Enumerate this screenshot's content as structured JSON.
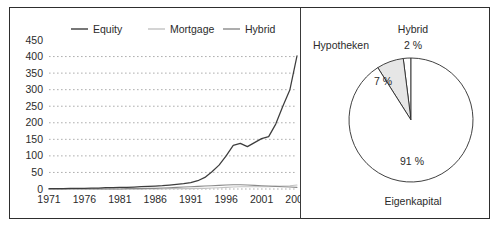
{
  "figure": {
    "width": 499,
    "height": 227,
    "background": "#ffffff",
    "frame_color": "#2e2e2e"
  },
  "chart_data": [
    {
      "type": "line",
      "panel": "left",
      "title": "",
      "xlabel": "",
      "ylabel": "",
      "xlim": [
        1971,
        2006
      ],
      "ylim": [
        0,
        450
      ],
      "ytick_step": 50,
      "xtick_step": 5,
      "grid": "horizontal-dashed",
      "legend_position": "top",
      "ytick_labels": [
        "0",
        "50",
        "100",
        "150",
        "200",
        "250",
        "300",
        "350",
        "400",
        "450"
      ],
      "ytick_values": [
        0,
        50,
        100,
        150,
        200,
        250,
        300,
        350,
        400,
        450
      ],
      "xtick_labels": [
        "1971",
        "1976",
        "1981",
        "1986",
        "1991",
        "1996",
        "2001",
        "2006"
      ],
      "xtick_values": [
        1971,
        1976,
        1981,
        1986,
        1991,
        1996,
        2001,
        2006
      ],
      "x": [
        1971,
        1972,
        1973,
        1974,
        1975,
        1976,
        1977,
        1978,
        1979,
        1980,
        1981,
        1982,
        1983,
        1984,
        1985,
        1986,
        1987,
        1988,
        1989,
        1990,
        1991,
        1992,
        1993,
        1994,
        1995,
        1996,
        1997,
        1998,
        1999,
        2000,
        2001,
        2002,
        2003,
        2004,
        2005,
        2006
      ],
      "series": [
        {
          "name": "Equity",
          "color": "#3d3d3d",
          "values": [
            1,
            1,
            1,
            2,
            2,
            2,
            3,
            3,
            4,
            4,
            5,
            5,
            6,
            7,
            8,
            9,
            10,
            12,
            14,
            16,
            19,
            25,
            35,
            52,
            72,
            100,
            132,
            138,
            128,
            140,
            152,
            158,
            196,
            250,
            300,
            402
          ]
        },
        {
          "name": "Mortgage",
          "color": "#c2c2c2",
          "values": [
            0,
            0,
            0,
            0,
            0,
            0,
            0,
            0,
            0,
            0,
            0,
            0,
            0,
            0,
            0,
            0,
            0,
            1,
            1,
            1,
            1,
            2,
            2,
            3,
            4,
            5,
            6,
            7,
            7,
            7,
            7,
            7,
            8,
            9,
            10,
            12
          ]
        },
        {
          "name": "Hybrid",
          "color": "#8a8a8a",
          "values": [
            0,
            0,
            0,
            0,
            0,
            0,
            0,
            0,
            0,
            0,
            0,
            1,
            1,
            1,
            2,
            2,
            3,
            4,
            5,
            6,
            7,
            8,
            9,
            10,
            11,
            12,
            13,
            13,
            12,
            11,
            10,
            9,
            8,
            7,
            6,
            5
          ]
        }
      ],
      "legend": [
        {
          "label": "Equity",
          "color": "#3d3d3d"
        },
        {
          "label": "Mortgage",
          "color": "#c2c2c2"
        },
        {
          "label": "Hybrid",
          "color": "#8a8a8a"
        }
      ]
    },
    {
      "type": "pie",
      "panel": "right",
      "title": "",
      "slices": [
        {
          "label": "Eigenkapital",
          "percent_text": "91 %",
          "value": 91,
          "fill": "#ffffff",
          "stroke": "#2b2b2b"
        },
        {
          "label": "Hypotheken",
          "percent_text": "7 %",
          "value": 7,
          "fill": "#e6e6e6",
          "stroke": "#2b2b2b"
        },
        {
          "label": "Hybrid",
          "percent_text": "2 %",
          "value": 2,
          "fill": "#ffffff",
          "stroke": "#2b2b2b"
        }
      ]
    }
  ]
}
